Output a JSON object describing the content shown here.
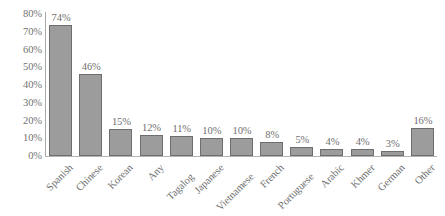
{
  "chart_data": {
    "type": "bar",
    "title": "",
    "subtitle": "",
    "xlabel": "",
    "ylabel": "",
    "ylim": [
      0,
      80
    ],
    "grid": false,
    "legend": false,
    "orientation": "vertical",
    "value_suffix": "%",
    "categories": [
      "Spanish",
      "Chinese",
      "Korean",
      "Any",
      "Tagalog",
      "Japanese",
      "Vietnamese",
      "French",
      "Portuguese",
      "Arabic",
      "Khmer",
      "German",
      "Other"
    ],
    "values": [
      74,
      46,
      15,
      12,
      11,
      10,
      10,
      8,
      5,
      4,
      4,
      3,
      16
    ],
    "data_labels": [
      "74%",
      "46%",
      "15%",
      "12%",
      "11%",
      "10%",
      "10%",
      "8%",
      "5%",
      "4%",
      "4%",
      "3%",
      "16%"
    ],
    "y_ticks": [
      0,
      10,
      20,
      30,
      40,
      50,
      60,
      70,
      80
    ],
    "y_tick_labels": [
      "0%",
      "10%",
      "20%",
      "30%",
      "40%",
      "50%",
      "60%",
      "70%",
      "80%"
    ],
    "colors": {
      "bar_fill": "#9c9c9c",
      "bar_border": "#6e6e6e",
      "axis": "#a8a8a8",
      "text": "#6f6f6f",
      "background": "#ffffff"
    }
  }
}
